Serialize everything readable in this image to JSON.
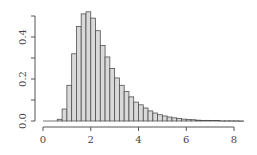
{
  "chart_data": {
    "type": "bar",
    "subtype": "histogram",
    "title": "",
    "xlabel": "",
    "ylabel": "",
    "bin_width": 0.2,
    "bin_starts": [
      0.0,
      0.2,
      0.4,
      0.6,
      0.8,
      1.0,
      1.2,
      1.4,
      1.6,
      1.8,
      2.0,
      2.2,
      2.4,
      2.6,
      2.8,
      3.0,
      3.2,
      3.4,
      3.6,
      3.8,
      4.0,
      4.2,
      4.4,
      4.6,
      4.8,
      5.0,
      5.2,
      5.4,
      5.6,
      5.8,
      6.0,
      6.2,
      6.4,
      6.6,
      6.8,
      7.0,
      7.2,
      7.4,
      7.6,
      7.8,
      8.0,
      8.2
    ],
    "values": [
      0,
      0,
      0,
      0.008,
      0.057,
      0.17,
      0.32,
      0.45,
      0.51,
      0.52,
      0.49,
      0.43,
      0.36,
      0.305,
      0.25,
      0.205,
      0.17,
      0.14,
      0.115,
      0.09,
      0.077,
      0.062,
      0.048,
      0.038,
      0.03,
      0.024,
      0.019,
      0.015,
      0.012,
      0.009,
      0.007,
      0.006,
      0.004,
      0.003,
      0.003,
      0.002,
      0.002,
      0.001,
      0.001,
      0.001,
      0.001,
      0.0005
    ],
    "xlim": [
      0,
      8.3
    ],
    "ylim": [
      0,
      0.5
    ],
    "x_ticks": [
      0,
      2,
      4,
      6,
      8
    ],
    "x_tick_labels": [
      "0",
      "2",
      "4",
      "6",
      "8"
    ],
    "y_ticks": [
      0.0,
      0.1,
      0.2,
      0.3,
      0.4,
      0.5
    ],
    "y_tick_labels": [
      "0.0",
      "",
      "0.2",
      "",
      "0.4",
      ""
    ],
    "grid": false,
    "legend": null,
    "colors": {
      "bar_fill": "#d9d9d9",
      "bar_stroke": "#505050",
      "axis": "#555555"
    }
  }
}
